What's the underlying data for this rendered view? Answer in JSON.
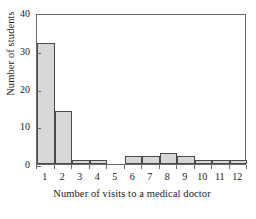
{
  "chart_data": {
    "type": "bar",
    "title": "",
    "subtitle": "",
    "xlabel": "Number of visits to a medical doctor",
    "ylabel": "Number of students",
    "categories": [
      "1",
      "2",
      "3",
      "4",
      "5",
      "6",
      "7",
      "8",
      "9",
      "10",
      "11",
      "12"
    ],
    "values": [
      32,
      14,
      1,
      1,
      0,
      2,
      2,
      3,
      2,
      1,
      1,
      1
    ],
    "series": [
      {
        "name": "Number of students",
        "values": [
          32,
          14,
          1,
          1,
          0,
          2,
          2,
          3,
          2,
          1,
          1,
          1
        ]
      }
    ],
    "xlim": [
      0.5,
      12.5
    ],
    "ylim": [
      0,
      40
    ],
    "ytick_labels": [
      "0",
      "10",
      "20",
      "30",
      "40"
    ],
    "ytick_values": [
      0,
      10,
      20,
      30,
      40
    ],
    "xtick_labels": [
      "1",
      "2",
      "3",
      "4",
      "5",
      "6",
      "7",
      "8",
      "9",
      "10",
      "11",
      "12"
    ],
    "xtick_values": [
      1,
      2,
      3,
      4,
      5,
      6,
      7,
      8,
      9,
      10,
      11,
      12
    ],
    "grid": false,
    "legend": false,
    "legend_position": "none",
    "annotations": [],
    "colors": {
      "bar_fill": "#d6d8d7",
      "bar_edge": "#4a4a4a",
      "axis": "#6b6b6b",
      "text": "#1a1a1a",
      "background": "#ffffff"
    }
  }
}
